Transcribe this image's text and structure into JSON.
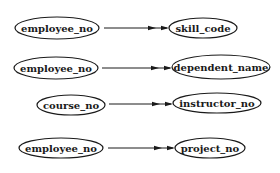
{
  "diagram": {
    "type": "functional-dependency-graph",
    "nodes": [
      {
        "id": "n1",
        "label": "employee_no",
        "cx": 57,
        "cy": 28,
        "rx": 42,
        "ry": 11
      },
      {
        "id": "n2",
        "label": "skill_code",
        "cx": 203,
        "cy": 28,
        "rx": 34,
        "ry": 10
      },
      {
        "id": "n3",
        "label": "employee_no",
        "cx": 56,
        "cy": 68,
        "rx": 42,
        "ry": 11
      },
      {
        "id": "n4",
        "label": "dependent_name",
        "cx": 221,
        "cy": 67,
        "rx": 49,
        "ry": 12
      },
      {
        "id": "n5",
        "label": "course_no",
        "cx": 71,
        "cy": 105,
        "rx": 34,
        "ry": 10
      },
      {
        "id": "n6",
        "label": "instructor_no",
        "cx": 217,
        "cy": 103,
        "rx": 44,
        "ry": 10
      },
      {
        "id": "n7",
        "label": "employee_no",
        "cx": 61,
        "cy": 148,
        "rx": 42,
        "ry": 10
      },
      {
        "id": "n8",
        "label": "project_no",
        "cx": 210,
        "cy": 148,
        "rx": 35,
        "ry": 10
      }
    ],
    "edges": [
      {
        "from": "employee_no",
        "to": "skill_code",
        "x1": 104,
        "y1": 28,
        "x2": 169,
        "y2": 28,
        "arrow": "double"
      },
      {
        "from": "employee_no",
        "to": "dependent_name",
        "x1": 102,
        "y1": 68,
        "x2": 172,
        "y2": 68,
        "arrow": "double"
      },
      {
        "from": "course_no",
        "to": "instructor_no",
        "x1": 109,
        "y1": 104,
        "x2": 173,
        "y2": 104,
        "arrow": "double"
      },
      {
        "from": "employee_no",
        "to": "project_no",
        "x1": 108,
        "y1": 148,
        "x2": 175,
        "y2": 148,
        "arrow": "double"
      }
    ]
  },
  "colors": {
    "stroke": "#1a1a1a",
    "background": "#ffffff"
  }
}
